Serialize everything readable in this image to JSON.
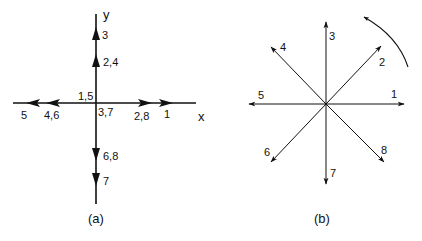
{
  "panel_a": {
    "caption": "(a)",
    "axis_x_label": "x",
    "axis_y_label": "y",
    "origin_labels": {
      "upper_left": "1,5",
      "lower_right": "3,7"
    },
    "arrow_labels": {
      "y_up_far": "3",
      "y_up_near": "2,4",
      "y_down_near": "6,8",
      "y_down_far": "7",
      "x_left_far": "5",
      "x_left_near": "4,6",
      "x_right_near": "2,8",
      "x_right_far": "1"
    }
  },
  "panel_b": {
    "caption": "(b)",
    "directions": [
      {
        "label": "1",
        "angle_deg": 0
      },
      {
        "label": "2",
        "angle_deg": 45
      },
      {
        "label": "3",
        "angle_deg": 90
      },
      {
        "label": "4",
        "angle_deg": 135
      },
      {
        "label": "5",
        "angle_deg": 180
      },
      {
        "label": "6",
        "angle_deg": 225
      },
      {
        "label": "7",
        "angle_deg": 270
      },
      {
        "label": "8",
        "angle_deg": 315
      }
    ],
    "rotation_arrow": "counterclockwise"
  },
  "colors": {
    "stroke": "#111111",
    "background": "#ffffff"
  }
}
